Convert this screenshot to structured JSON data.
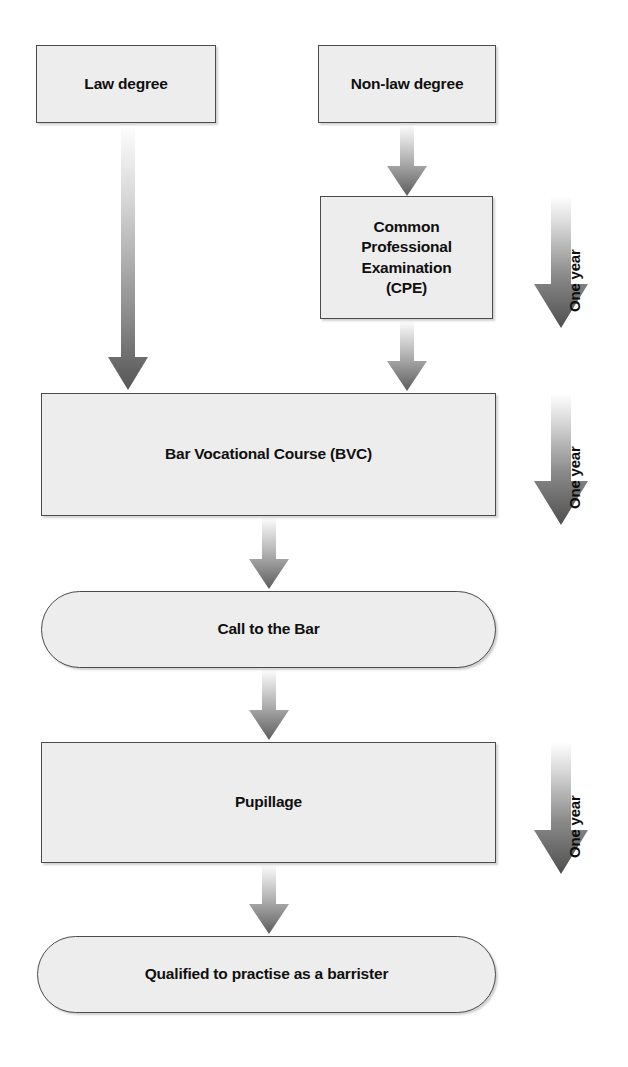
{
  "diagram": {
    "type": "flowchart",
    "nodes": [
      {
        "id": "law-degree",
        "label": "Law degree",
        "shape": "rectangle"
      },
      {
        "id": "nonlaw-degree",
        "label": "Non-law degree",
        "shape": "rectangle"
      },
      {
        "id": "cpe",
        "label": "Common\nProfessional\nExamination\n(CPE)",
        "shape": "rectangle"
      },
      {
        "id": "bvc",
        "label": "Bar Vocational Course (BVC)",
        "shape": "rectangle"
      },
      {
        "id": "call-to-bar",
        "label": "Call to the Bar",
        "shape": "pill"
      },
      {
        "id": "pupillage",
        "label": "Pupillage",
        "shape": "rectangle"
      },
      {
        "id": "qualified",
        "label": "Qualified to practise as a barrister",
        "shape": "pill"
      }
    ],
    "durations": [
      {
        "id": "duration-1",
        "label": "One year",
        "applies_to": "cpe"
      },
      {
        "id": "duration-2",
        "label": "One year",
        "applies_to": "bvc"
      },
      {
        "id": "duration-3",
        "label": "One year",
        "applies_to": "pupillage"
      }
    ],
    "edges": [
      {
        "from": "law-degree",
        "to": "bvc"
      },
      {
        "from": "nonlaw-degree",
        "to": "cpe"
      },
      {
        "from": "cpe",
        "to": "bvc"
      },
      {
        "from": "bvc",
        "to": "call-to-bar"
      },
      {
        "from": "call-to-bar",
        "to": "pupillage"
      },
      {
        "from": "pupillage",
        "to": "qualified"
      }
    ],
    "colors": {
      "node_fill": "#ededed",
      "node_border": "#4b4b4b",
      "arrow_dark": "#595959",
      "arrow_light": "#ffffff",
      "text": "#101010",
      "background": "#ffffff"
    }
  }
}
